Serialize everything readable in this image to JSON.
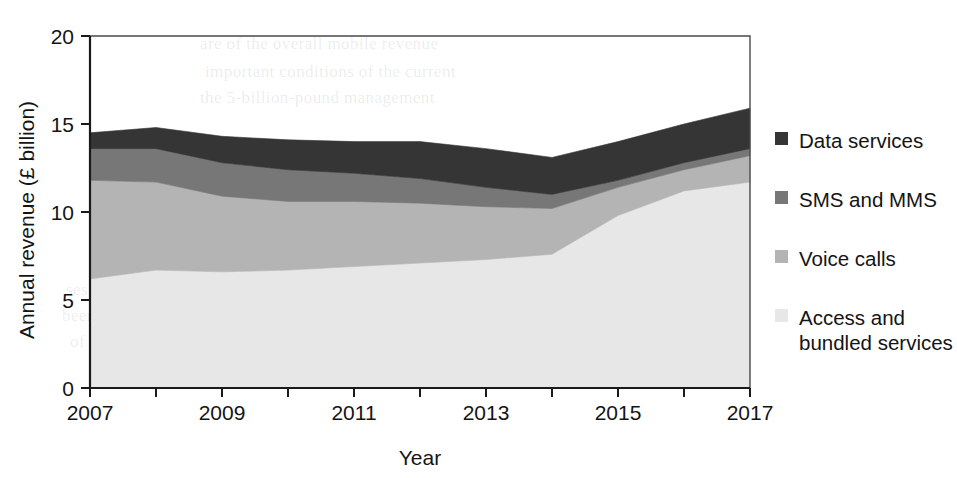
{
  "figure": {
    "background_color": "#ffffff",
    "width": 957,
    "height": 478
  },
  "axes": {
    "y_title": "Annual revenue (£ billion)",
    "x_title": "Year",
    "y_ticks": [
      "0",
      "5",
      "10",
      "15",
      "20"
    ],
    "x_ticks": [
      "2007",
      "2009",
      "2011",
      "2013",
      "2015",
      "2017"
    ]
  },
  "legend": {
    "items": [
      {
        "label": "Data services",
        "color": "#353535"
      },
      {
        "label": "SMS and MMS",
        "color": "#777777"
      },
      {
        "label": "Voice calls",
        "color": "#b4b4b4"
      },
      {
        "label": "Access and\nbundled services",
        "color": "#e7e7e7"
      }
    ]
  },
  "ghost_text": [
    {
      "text": "are of the overall mobile revenue",
      "x": 200,
      "y": 34
    },
    {
      "text": "important conditions of the current",
      "x": 205,
      "y": 62
    },
    {
      "text": "the 5-billion-pound management",
      "x": 200,
      "y": 88
    },
    {
      "text": "revenue for the four main",
      "x": 330,
      "y": 172
    },
    {
      "text": "for the connections, 1.3 billion",
      "x": 230,
      "y": 198
    },
    {
      "text": "2007–2017",
      "x": 490,
      "y": 206
    },
    {
      "text": "ly in real terms",
      "x": 100,
      "y": 226
    },
    {
      "text": "rises at a rate and that the price indices are",
      "x": 108,
      "y": 254
    },
    {
      "text": "ses. On the other hand, while the index expression slows yet",
      "x": 66,
      "y": 280
    },
    {
      "text": "been flat. These trends deliver the data that the two enjoy the",
      "x": 62,
      "y": 306
    },
    {
      "text": "of indications, at least the survey is concluded, and that the",
      "x": 70,
      "y": 332
    },
    {
      "text": "mobile share is a measure of the growing market",
      "x": 140,
      "y": 358
    }
  ],
  "chart_data": {
    "type": "area",
    "stacked": true,
    "title": "",
    "xlabel": "Year",
    "ylabel": "Annual revenue (£ billion)",
    "xlim": [
      2007,
      2017
    ],
    "ylim": [
      0,
      20
    ],
    "grid": false,
    "legend_position": "right",
    "x": [
      2007,
      2008,
      2009,
      2010,
      2011,
      2012,
      2013,
      2014,
      2015,
      2016,
      2017
    ],
    "series": [
      {
        "name": "Access and bundled services",
        "color": "#e7e7e7",
        "values": [
          6.2,
          6.7,
          6.6,
          6.7,
          6.9,
          7.1,
          7.3,
          7.6,
          9.8,
          11.2,
          11.7
        ]
      },
      {
        "name": "Voice calls",
        "color": "#b4b4b4",
        "values": [
          5.6,
          5.0,
          4.3,
          3.9,
          3.7,
          3.4,
          3.0,
          2.6,
          1.6,
          1.2,
          1.5
        ]
      },
      {
        "name": "SMS and MMS",
        "color": "#777777",
        "values": [
          1.8,
          1.9,
          1.9,
          1.8,
          1.6,
          1.4,
          1.1,
          0.8,
          0.4,
          0.4,
          0.4
        ]
      },
      {
        "name": "Data services",
        "color": "#353535",
        "values": [
          0.9,
          1.2,
          1.5,
          1.7,
          1.8,
          2.1,
          2.2,
          2.1,
          2.2,
          2.2,
          2.3
        ]
      }
    ],
    "totals": [
      14.5,
      14.8,
      14.3,
      14.1,
      14.0,
      16.0,
      13.6,
      13.1,
      14.0,
      15.0,
      15.9
    ]
  }
}
